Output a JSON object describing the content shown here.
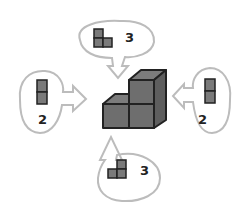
{
  "diagram": {
    "colors": {
      "cube_face": "#6e6e6e",
      "cube_top": "#7c7c7c",
      "cube_side": "#5e5e5e",
      "outline": "#222222",
      "bubble": "#bcbcbc"
    },
    "views": [
      {
        "position": "top",
        "count": "3"
      },
      {
        "position": "left",
        "count": "2"
      },
      {
        "position": "right",
        "count": "2"
      },
      {
        "position": "bottom",
        "count": "3"
      }
    ]
  }
}
